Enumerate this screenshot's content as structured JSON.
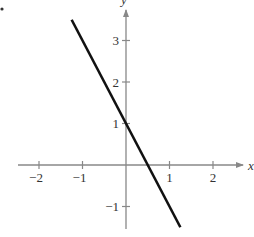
{
  "chart_data": {
    "type": "line",
    "title": "",
    "xlabel": "x",
    "ylabel": "y",
    "xlim": [
      -2.5,
      2.8
    ],
    "ylim": [
      -1.6,
      3.8
    ],
    "grid": false,
    "legend": null,
    "x_ticks": [
      -2,
      -1,
      1,
      2
    ],
    "x_tick_labels": [
      "−2",
      "−1",
      "1",
      "2"
    ],
    "y_ticks": [
      -1,
      1,
      2,
      3
    ],
    "y_tick_labels": [
      "−1",
      "1",
      "2",
      "3"
    ],
    "series": [
      {
        "name": "y = -2x + 1",
        "x": [
          -1.25,
          1.25
        ],
        "y": [
          3.5,
          -1.5
        ],
        "color": "#111111"
      }
    ],
    "annotations": [
      "bullet dot at top-left corner"
    ]
  },
  "colors": {
    "axis": "#888888",
    "line": "#111111",
    "text": "#333333"
  }
}
